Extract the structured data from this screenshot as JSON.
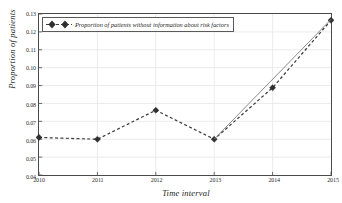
{
  "chart_data": {
    "type": "line",
    "title": "",
    "xlabel": "Time interval",
    "ylabel": "Proportion of patients",
    "x": [
      2010,
      2011,
      2012,
      2013,
      2014,
      2015
    ],
    "xticklabels": [
      "2010",
      "2011",
      "2012",
      "2013",
      "2014",
      "2015"
    ],
    "xlim": [
      2010,
      2015
    ],
    "ylim": [
      0.04,
      0.13
    ],
    "yticks": [
      0.04,
      0.05,
      0.06,
      0.07,
      0.08,
      0.09,
      0.1,
      0.11,
      0.12,
      0.13
    ],
    "yticklabels": [
      "0.04",
      "0.05",
      "0.06",
      "0.07",
      "0.08",
      "0.09",
      "0.10",
      "0.11",
      "0.12",
      "0.13"
    ],
    "grid": true,
    "legend_position": "upper left",
    "series": [
      {
        "name": "Proportion of patients without information about risk factors",
        "values": [
          0.061,
          0.06,
          0.0762,
          0.06,
          0.0888,
          0.1265
        ],
        "linestyle": "dashed",
        "marker": "diamond",
        "color": "#3d3d3d"
      },
      {
        "name": "trend",
        "x": [
          2013,
          2015
        ],
        "values": [
          0.06,
          0.127
        ],
        "linestyle": "solid",
        "marker": "none",
        "color": "#8a8a8a"
      }
    ]
  },
  "legend": {
    "label": "Proportion of patients without information about risk factors",
    "marker_icon": "diamond-marker"
  },
  "axes": {
    "x_title": "Time interval",
    "y_title": "Proportion of patients"
  },
  "colors": {
    "series": "#3d3d3d",
    "trend": "#8a8a8a",
    "grid": "#e8e8e8",
    "frame": "#4a4a4a",
    "background": "#ffffff"
  }
}
